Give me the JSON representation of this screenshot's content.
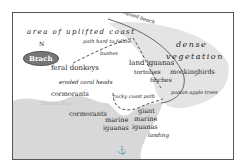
{
  "map": {
    "compass": {
      "north_label": "N",
      "badge_label": "Brach"
    },
    "regions": {
      "uplifted_coast": "area of uplifted coast",
      "dense_vegetation_line1": "dense",
      "dense_vegetation_line2": "vegetation"
    },
    "paths": {
      "raised_beach": "raised beach",
      "path_hard": "path hard to follow",
      "rocky_coast_path": "rocky coast path"
    },
    "features": {
      "bushes": "bushes",
      "eroded_coral": "eroded coral heads",
      "poison_apple": "poison apple trees",
      "landing": "landing",
      "coast_faint": "Darwin Bay"
    },
    "wildlife": {
      "feral_donkeys": "feral donkeys",
      "cormorants_top": "cormorants",
      "cormorants_bottom": "cormorants",
      "land_iguanas": "land iguanas",
      "tortoises": "tortoises",
      "finches": "finches",
      "mockingbirds": "mockingbirds",
      "marine_iguanas_1": "marine",
      "marine_iguanas_1b": "iguanas",
      "giant_marine_1": "giant",
      "giant_marine_2": "marine",
      "giant_marine_3": "iguanas"
    },
    "colors": {
      "land": "#ffffff",
      "vegetation": "#e3e3e3",
      "sea": "#d6d6d6",
      "border": "#555555"
    }
  }
}
